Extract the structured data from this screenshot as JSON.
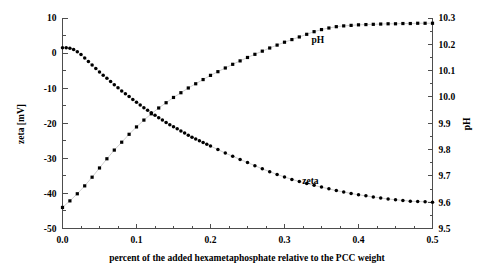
{
  "chart_data": {
    "type": "scatter",
    "title": "",
    "subtitle": "",
    "xlabel": "percent of the added hexametaphosphate relative to the PCC weight",
    "ylabel": "zeta [mV]",
    "y2label": "pH",
    "xlim": [
      0.0,
      0.5
    ],
    "ylim": [
      -50,
      10
    ],
    "y2lim": [
      9.5,
      10.3
    ],
    "xticks": [
      0.0,
      0.1,
      0.2,
      0.3,
      0.4,
      0.5
    ],
    "xticklabels": [
      "0.0",
      "0.1",
      "0.2",
      "0.3",
      "0.4",
      "0.5"
    ],
    "yticks": [
      -50,
      -40,
      -30,
      -20,
      -10,
      0,
      10
    ],
    "yticklabels": [
      "-50",
      "-40",
      "-30",
      "-20",
      "-10",
      "0",
      "10"
    ],
    "y2ticks": [
      9.5,
      9.6,
      9.7,
      9.8,
      9.9,
      10.0,
      10.1,
      10.2,
      10.3
    ],
    "y2ticklabels": [
      "9.5",
      "9.6",
      "9.7",
      "9.8",
      "9.9",
      "10.0",
      "10.1",
      "10.2",
      "10.3"
    ],
    "x_minor_step": 0.025,
    "y_minor_step": 5,
    "y2_minor_step": 0.05,
    "grid": false,
    "legend_position": "inline-annotations",
    "marker_color": "#000000",
    "axis_color": "#4d4d4d",
    "annotations": [
      {
        "text": "pH",
        "x": 0.345,
        "y2": 10.205
      },
      {
        "text": "zeta",
        "x": 0.335,
        "y": -37.3
      }
    ],
    "series": [
      {
        "name": "zeta",
        "axis": "left",
        "marker": "filled-circle",
        "x": [
          0.0,
          0.005,
          0.01,
          0.015,
          0.02,
          0.025,
          0.03,
          0.035,
          0.04,
          0.045,
          0.05,
          0.055,
          0.06,
          0.065,
          0.07,
          0.075,
          0.08,
          0.085,
          0.09,
          0.095,
          0.1,
          0.105,
          0.11,
          0.115,
          0.12,
          0.125,
          0.13,
          0.135,
          0.14,
          0.145,
          0.15,
          0.155,
          0.16,
          0.165,
          0.17,
          0.175,
          0.18,
          0.185,
          0.19,
          0.195,
          0.2,
          0.21,
          0.22,
          0.23,
          0.24,
          0.25,
          0.26,
          0.27,
          0.28,
          0.29,
          0.3,
          0.31,
          0.32,
          0.33,
          0.34,
          0.35,
          0.36,
          0.37,
          0.38,
          0.39,
          0.4,
          0.41,
          0.42,
          0.43,
          0.44,
          0.45,
          0.46,
          0.47,
          0.48,
          0.49,
          0.5
        ],
        "y": [
          1.5,
          1.5,
          1.4,
          1.0,
          0.4,
          -0.4,
          -1.4,
          -2.4,
          -3.4,
          -4.4,
          -5.4,
          -6.3,
          -7.2,
          -8.1,
          -9.0,
          -9.9,
          -10.8,
          -11.6,
          -12.4,
          -13.2,
          -14.0,
          -14.8,
          -15.6,
          -16.3,
          -17.0,
          -17.7,
          -18.4,
          -19.1,
          -19.8,
          -20.4,
          -21.0,
          -21.6,
          -22.2,
          -22.8,
          -23.4,
          -24.0,
          -24.5,
          -25.0,
          -25.5,
          -26.0,
          -26.5,
          -27.5,
          -28.5,
          -29.4,
          -30.3,
          -31.2,
          -32.1,
          -33.0,
          -33.8,
          -34.6,
          -35.3,
          -36.0,
          -36.6,
          -37.2,
          -37.7,
          -38.2,
          -38.7,
          -39.2,
          -39.6,
          -40.0,
          -40.4,
          -40.7,
          -41.0,
          -41.3,
          -41.6,
          -41.8,
          -42.0,
          -42.2,
          -42.3,
          -42.4,
          -42.5
        ]
      },
      {
        "name": "pH",
        "axis": "right",
        "marker": "filled-square",
        "x": [
          0.0,
          0.01,
          0.02,
          0.03,
          0.04,
          0.05,
          0.06,
          0.07,
          0.08,
          0.09,
          0.1,
          0.11,
          0.12,
          0.13,
          0.14,
          0.15,
          0.16,
          0.17,
          0.18,
          0.19,
          0.2,
          0.21,
          0.22,
          0.23,
          0.24,
          0.25,
          0.26,
          0.27,
          0.28,
          0.29,
          0.3,
          0.31,
          0.32,
          0.33,
          0.34,
          0.35,
          0.36,
          0.37,
          0.38,
          0.39,
          0.4,
          0.41,
          0.42,
          0.43,
          0.44,
          0.45,
          0.46,
          0.47,
          0.48,
          0.49,
          0.5
        ],
        "y": [
          9.58,
          9.605,
          9.632,
          9.662,
          9.695,
          9.73,
          9.765,
          9.798,
          9.828,
          9.858,
          9.886,
          9.912,
          9.936,
          9.958,
          9.978,
          9.998,
          10.016,
          10.034,
          10.05,
          10.066,
          10.082,
          10.096,
          10.11,
          10.124,
          10.137,
          10.15,
          10.162,
          10.174,
          10.186,
          10.197,
          10.208,
          10.218,
          10.228,
          10.238,
          10.248,
          10.256,
          10.262,
          10.267,
          10.27,
          10.272,
          10.274,
          10.275,
          10.276,
          10.277,
          10.278,
          10.278,
          10.279,
          10.279,
          10.28,
          10.28,
          10.28
        ]
      }
    ]
  },
  "labels": {
    "xlabel": "percent of the added hexametaphosphate relative to the PCC weight",
    "ylabel_left": "zeta [mV]",
    "ylabel_right": "pH",
    "series_zeta": "zeta",
    "series_ph": "pH"
  }
}
